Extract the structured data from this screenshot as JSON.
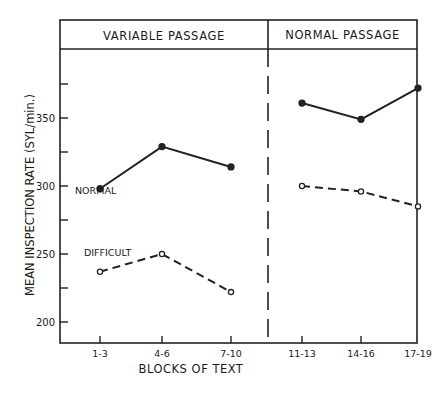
{
  "chart_data": {
    "type": "line",
    "title": "",
    "panels": [
      {
        "label": "VARIABLE PASSAGE",
        "categories": [
          "1-3",
          "4-6",
          "7-10"
        ]
      },
      {
        "label": "NORMAL PASSAGE",
        "categories": [
          "11-13",
          "14-16",
          "17-19"
        ]
      }
    ],
    "categories": [
      "1-3",
      "4-6",
      "7-10",
      "11-13",
      "14-16",
      "17-19"
    ],
    "series": [
      {
        "name": "NORMAL",
        "style": "solid",
        "marker": "filled-circle",
        "values": [
          298,
          329,
          314,
          361,
          349,
          372
        ]
      },
      {
        "name": "DIFFICULT",
        "style": "dashed",
        "marker": "open-circle",
        "values": [
          237,
          250,
          222,
          300,
          296,
          285
        ]
      }
    ],
    "xlabel": "BLOCKS OF TEXT",
    "ylabel": "MEAN INSPECTION RATE (SYL/min.)",
    "yticks": [
      200,
      250,
      300,
      350
    ],
    "ylim": [
      182,
      388
    ],
    "grid": false,
    "legend": "inline labels"
  }
}
